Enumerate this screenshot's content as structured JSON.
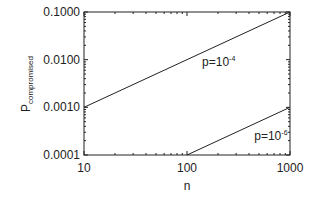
{
  "chart_data": {
    "type": "line",
    "title": "",
    "xlabel": "n",
    "ylabel": "P",
    "ylabel_subscript": "compromised",
    "xscale": "log",
    "yscale": "log",
    "xlim": [
      10,
      1000
    ],
    "ylim": [
      0.0001,
      0.1
    ],
    "grid": false,
    "legend": "none",
    "x_ticks": [
      {
        "value": 10,
        "label": "10"
      },
      {
        "value": 100,
        "label": "100"
      },
      {
        "value": 1000,
        "label": "1000"
      }
    ],
    "y_ticks": [
      {
        "value": 0.0001,
        "label": "0.0001"
      },
      {
        "value": 0.001,
        "label": "0.0010"
      },
      {
        "value": 0.01,
        "label": "0.0100"
      },
      {
        "value": 0.1,
        "label": "0.1000"
      }
    ],
    "series": [
      {
        "name": "p=10^-4",
        "label_base": "p=10",
        "label_exp": "-4",
        "x": [
          10,
          1000
        ],
        "y": [
          0.001,
          0.1
        ],
        "label_pos": {
          "n": 140,
          "P": 0.0075
        }
      },
      {
        "name": "p=10^-6",
        "label_base": "p=10",
        "label_exp": "-6",
        "x": [
          100,
          1000
        ],
        "y": [
          0.0001,
          0.001
        ],
        "label_pos": {
          "n": 450,
          "P": 0.00021
        }
      }
    ],
    "colors": {
      "axis": "#222222",
      "line": "#222222",
      "background": "#ffffff"
    }
  }
}
